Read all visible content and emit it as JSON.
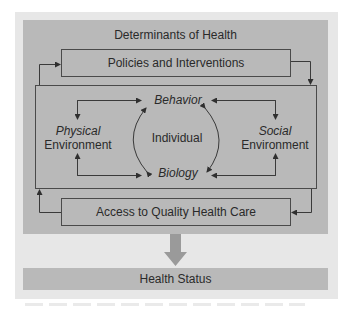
{
  "diagram": {
    "title": "Determinants of Health",
    "top_box": "Policies and Interventions",
    "bottom_box": "Access to Quality Health Care",
    "inner": {
      "center": "Individual",
      "top": "Behavior",
      "bottom": "Biology",
      "left": {
        "line1": "Physical",
        "line2": "Environment"
      },
      "right": {
        "line1": "Social",
        "line2": "Environment"
      }
    },
    "outcome": "Health Status"
  },
  "colors": {
    "outer_panel": "#e7e7e7",
    "box_fill": "#b9b9b9",
    "line": "#3a3a3a",
    "big_arrow": "#9a9a9a",
    "text": "#2a2a2a"
  }
}
